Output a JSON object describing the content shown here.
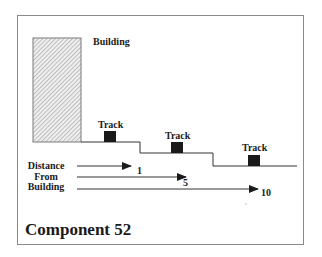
{
  "diagram": {
    "title": "Component 52",
    "building": {
      "label": "Building"
    },
    "tracks": [
      {
        "label": "Track"
      },
      {
        "label": "Track"
      },
      {
        "label": "Track"
      }
    ],
    "distance_legend": {
      "lines": [
        "Distance",
        "From",
        "Building"
      ]
    },
    "arrows": [
      {
        "value": "1"
      },
      {
        "value": "5"
      },
      {
        "value": "10"
      }
    ],
    "colors": {
      "frame": "#8a8a8a",
      "building_fill": "#d8d8d8",
      "track_fill": "#1a1a1a",
      "line": "#333333"
    }
  }
}
